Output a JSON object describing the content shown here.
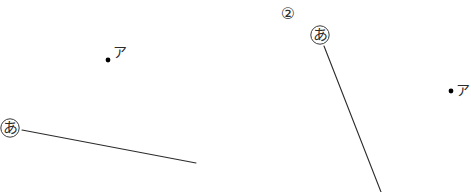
{
  "page": {
    "background_color": "#ffffff",
    "ink_color": "#2b2b2b",
    "width": 471,
    "height": 192
  },
  "figures": [
    {
      "id": "figure-1",
      "number_label": "",
      "vertex_marker": {
        "label": "あ",
        "circled": true,
        "x": 10,
        "y": 128
      },
      "ray": {
        "x1": 22,
        "y1": 130,
        "x2": 196,
        "y2": 163,
        "stroke_width": 1.1
      },
      "point": {
        "label": "ア",
        "dot_x": 108,
        "dot_y": 60,
        "dot_radius": 2.4,
        "label_x": 113,
        "label_y": 45
      }
    },
    {
      "id": "figure-2",
      "number_label": "②",
      "number_x": 288,
      "number_y": 14,
      "vertex_marker": {
        "label": "あ",
        "circled": true,
        "x": 320,
        "y": 35
      },
      "ray": {
        "x1": 324,
        "y1": 46,
        "x2": 381,
        "y2": 192,
        "stroke_width": 1.1
      },
      "point": {
        "label": "ア",
        "dot_x": 451,
        "dot_y": 91,
        "dot_radius": 2.4,
        "label_x": 456,
        "label_y": 83
      }
    }
  ]
}
